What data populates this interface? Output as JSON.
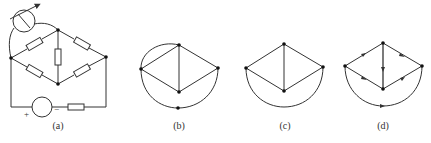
{
  "figure": {
    "panels": [
      {
        "id": "a",
        "label": "(a)",
        "type": "circuit"
      },
      {
        "id": "b",
        "label": "(b)",
        "type": "graph"
      },
      {
        "id": "c",
        "label": "(c)",
        "type": "graph"
      },
      {
        "id": "d",
        "label": "(d)",
        "type": "directed-graph"
      }
    ],
    "source_signs": {
      "plus": "+",
      "minus": "−"
    },
    "colors": {
      "line": "#333333",
      "node": "#111111",
      "background": "#ffffff"
    }
  }
}
